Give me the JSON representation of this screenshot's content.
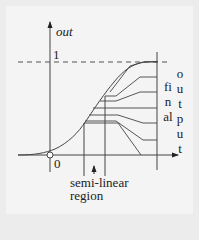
{
  "diagram": {
    "axes": {
      "y_label": "out",
      "y_tick": "1",
      "origin_label": "0"
    },
    "annotations": {
      "region_label_line1": "semi-linear",
      "region_label_line2": "region",
      "final_label": "final",
      "output_label": "output"
    },
    "colors": {
      "background": "#f4f4f4",
      "ink": "#333333"
    }
  }
}
